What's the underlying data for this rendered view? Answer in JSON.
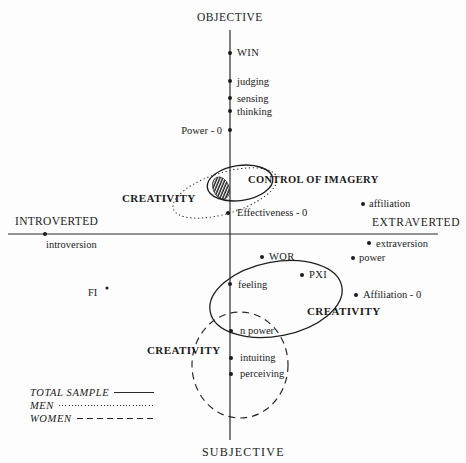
{
  "axes": {
    "top": "OBJECTIVE",
    "bottom": "SUBJECTIVE",
    "left": "INTROVERTED",
    "right": "EXTRAVERTED"
  },
  "points": {
    "win": "WIN",
    "judging": "judging",
    "sensing": "sensing",
    "thinking": "thinking",
    "power_0": "Power - 0",
    "effectiveness_0": "Effectiveness - 0",
    "affiliation": "affiliation",
    "introversion": "introversion",
    "extraversion": "extraversion",
    "power": "power",
    "wor": "WOR",
    "pxi": "PXI",
    "feeling": "feeling",
    "affiliation_0": "Affiliation - 0",
    "fi": "FI",
    "n_power": "n power",
    "intuiting": "intuiting",
    "perceiving": "perceiving"
  },
  "regions": {
    "control_of_imagery": "CONTROL OF IMAGERY",
    "creativity_upper": "CREATIVITY",
    "creativity_middle": "CREATIVITY",
    "creativity_lower": "CREATIVITY"
  },
  "legend": {
    "total_sample": "TOTAL SAMPLE",
    "men": "MEN",
    "women": "WOMEN"
  },
  "colors": {
    "ink": "#222222",
    "background": "#fdfdfd"
  }
}
